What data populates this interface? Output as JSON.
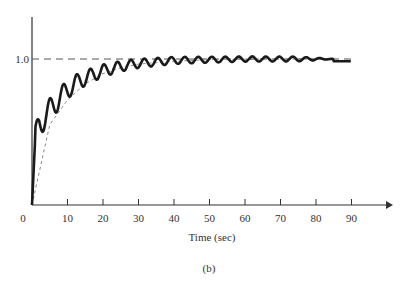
{
  "chart_data": {
    "type": "line",
    "title": "",
    "xlabel": "Time (sec)",
    "ylabel": "",
    "caption": "(b)",
    "xlim": [
      0,
      100
    ],
    "ylim": [
      0,
      1.25
    ],
    "x_ticks": [
      10,
      20,
      30,
      40,
      50,
      60,
      70,
      80,
      90
    ],
    "x_tick_labels": [
      "0",
      "10",
      "20",
      "30",
      "40",
      "50",
      "60",
      "70",
      "80",
      "90"
    ],
    "y_ticks": [
      1.0
    ],
    "y_tick_labels": [
      "1.0"
    ],
    "grid": false,
    "reference_line": {
      "y": 1.0,
      "style": "dashed"
    },
    "series": [
      {
        "name": "oscillatory response",
        "style": "solid-thick",
        "x": [
          0,
          1,
          2,
          4,
          6,
          8,
          10,
          12,
          15,
          20,
          25,
          30,
          35,
          40,
          50,
          60,
          70,
          80,
          85
        ],
        "envelope_values": [
          0,
          0.45,
          0.55,
          0.62,
          0.68,
          0.74,
          0.79,
          0.83,
          0.87,
          0.92,
          0.95,
          0.97,
          0.98,
          0.99,
          0.995,
          1.0,
          1.0,
          1.0,
          1.0
        ],
        "oscillation_period_sec": 3.8,
        "oscillation_amplitude_start": 0.1,
        "oscillation_amplitude_end": 0.015
      },
      {
        "name": "smooth (averaged) response",
        "style": "dashed-thin",
        "x": [
          0,
          5,
          10,
          15,
          20,
          25,
          30,
          40,
          50,
          60,
          70,
          80,
          85
        ],
        "values": [
          0,
          0.55,
          0.72,
          0.83,
          0.9,
          0.94,
          0.965,
          0.985,
          0.995,
          1.0,
          1.0,
          1.0,
          1.0
        ]
      }
    ]
  }
}
